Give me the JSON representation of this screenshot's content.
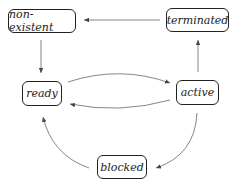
{
  "diagram": {
    "type": "state-transition",
    "states": [
      {
        "id": "non-existent",
        "label": "non-existent"
      },
      {
        "id": "terminated",
        "label": "terminated"
      },
      {
        "id": "ready",
        "label": "ready"
      },
      {
        "id": "active",
        "label": "active"
      },
      {
        "id": "blocked",
        "label": "blocked"
      }
    ],
    "transitions": [
      {
        "from": "terminated",
        "to": "non-existent"
      },
      {
        "from": "non-existent",
        "to": "ready"
      },
      {
        "from": "ready",
        "to": "active"
      },
      {
        "from": "active",
        "to": "ready"
      },
      {
        "from": "active",
        "to": "terminated"
      },
      {
        "from": "active",
        "to": "blocked"
      },
      {
        "from": "blocked",
        "to": "ready"
      }
    ],
    "colors": {
      "line": "#555555",
      "border": "#222222",
      "text": "#222222"
    }
  }
}
